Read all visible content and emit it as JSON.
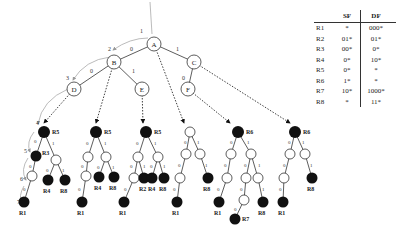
{
  "table": {
    "headers": [
      "",
      "SF",
      "DF"
    ],
    "rows": [
      {
        "rule": "R1",
        "sf": "*",
        "df": "000*"
      },
      {
        "rule": "R2",
        "sf": "01*",
        "df": "01*"
      },
      {
        "rule": "R3",
        "sf": "00*",
        "df": "0*"
      },
      {
        "rule": "R4",
        "sf": "0*",
        "df": "10*"
      },
      {
        "rule": "R5",
        "sf": "0*",
        "df": "*"
      },
      {
        "rule": "R6",
        "sf": "1*",
        "df": "*"
      },
      {
        "rule": "R7",
        "sf": "10*",
        "df": "1000*"
      },
      {
        "rule": "R8",
        "sf": "*",
        "df": "11*"
      }
    ]
  },
  "tree": {
    "nodes": {
      "A": "A",
      "B": "B",
      "C": "C",
      "D": "D",
      "E": "E",
      "F": "F"
    },
    "edge_labels": {
      "AB": "0",
      "AC": "1",
      "BD": "0",
      "BE": "1",
      "CF": "0"
    },
    "step_labels": [
      "1",
      "2",
      "3",
      "4",
      "5",
      "6",
      "7"
    ],
    "rule_labels": {
      "R1": "R1",
      "R2": "R2",
      "R3": "R3",
      "R4": "R4",
      "R5": "R5",
      "R6": "R6",
      "R7": "R7",
      "R8": "R8"
    }
  }
}
